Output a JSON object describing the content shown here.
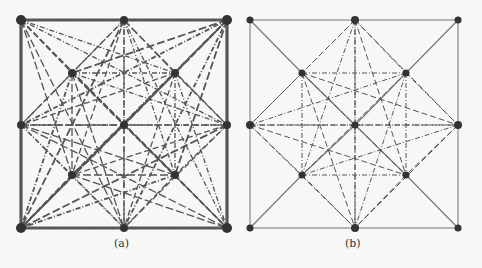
{
  "figure": {
    "panels": [
      {
        "id": "a",
        "caption": "(a)",
        "caption_x": 114,
        "nodes": [
          {
            "id": 0,
            "x": 21,
            "y": 20
          },
          {
            "id": 1,
            "x": 124,
            "y": 20
          },
          {
            "id": 2,
            "x": 227,
            "y": 20
          },
          {
            "id": 3,
            "x": 72,
            "y": 73
          },
          {
            "id": 4,
            "x": 175,
            "y": 73
          },
          {
            "id": 5,
            "x": 21,
            "y": 125
          },
          {
            "id": 6,
            "x": 124,
            "y": 125
          },
          {
            "id": 7,
            "x": 227,
            "y": 125
          },
          {
            "id": 8,
            "x": 72,
            "y": 175
          },
          {
            "id": 9,
            "x": 175,
            "y": 175
          },
          {
            "id": 10,
            "x": 21,
            "y": 228
          },
          {
            "id": 11,
            "x": 124,
            "y": 228
          },
          {
            "id": 12,
            "x": 227,
            "y": 228
          }
        ],
        "style": "dense"
      },
      {
        "id": "b",
        "caption": "(b)",
        "caption_x": 345,
        "nodes": [
          {
            "id": 0,
            "x": 250,
            "y": 20
          },
          {
            "id": 1,
            "x": 355,
            "y": 20
          },
          {
            "id": 2,
            "x": 458,
            "y": 20
          },
          {
            "id": 3,
            "x": 302,
            "y": 73
          },
          {
            "id": 4,
            "x": 406,
            "y": 73
          },
          {
            "id": 5,
            "x": 250,
            "y": 125
          },
          {
            "id": 6,
            "x": 355,
            "y": 125
          },
          {
            "id": 7,
            "x": 458,
            "y": 125
          },
          {
            "id": 8,
            "x": 302,
            "y": 175
          },
          {
            "id": 9,
            "x": 406,
            "y": 175
          },
          {
            "id": 10,
            "x": 250,
            "y": 228
          },
          {
            "id": 11,
            "x": 355,
            "y": 228
          },
          {
            "id": 12,
            "x": 458,
            "y": 228
          }
        ],
        "style": "sparse"
      }
    ],
    "colors": {
      "edge": "#555555",
      "edge_light": "#777777",
      "node": "#333333",
      "border_heavy": "#5a5a5a"
    }
  }
}
